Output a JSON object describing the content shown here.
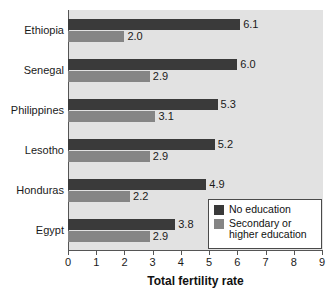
{
  "chart_data": {
    "type": "bar",
    "orientation": "horizontal",
    "title": "",
    "xlabel": "Total fertility rate",
    "ylabel": "",
    "xlim": [
      0,
      9
    ],
    "xticks": [
      "0",
      "1",
      "2",
      "3",
      "4",
      "5",
      "6",
      "7",
      "8",
      "9"
    ],
    "grid": false,
    "legend_position": "bottom-right",
    "categories": [
      "Ethiopia",
      "Senegal",
      "Philippines",
      "Lesotho",
      "Honduras",
      "Egypt"
    ],
    "series": [
      {
        "name": "No education",
        "color": "#3a3a3a",
        "values": [
          6.1,
          6.0,
          5.3,
          5.2,
          4.9,
          3.8
        ],
        "labels": [
          "6.1",
          "6.0",
          "5.3",
          "5.2",
          "4.9",
          "3.8"
        ]
      },
      {
        "name": "Secondary or higher education",
        "color": "#858585",
        "values": [
          2.0,
          2.9,
          3.1,
          2.9,
          2.2,
          2.9
        ],
        "labels": [
          "2.0",
          "2.9",
          "3.1",
          "2.9",
          "2.2",
          "2.9"
        ]
      }
    ]
  },
  "legend": {
    "entries": [
      {
        "label": "No education",
        "color": "#3a3a3a"
      },
      {
        "label": "Secondary or\nhigher education",
        "color": "#858585"
      }
    ]
  },
  "colors": {
    "plot_background": "#e2e2e2",
    "page_background": "#ffffff",
    "axis": "#555555",
    "text": "#1a1a1a",
    "series_primary": "#3a3a3a",
    "series_secondary": "#858585"
  }
}
